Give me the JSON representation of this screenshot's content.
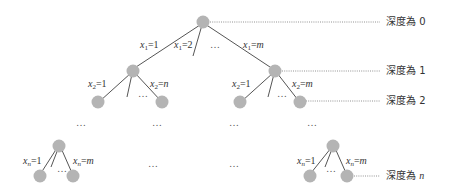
{
  "diagram": {
    "depth_labels": [
      {
        "text": "深度為 0",
        "prefix": "深度為 ",
        "value": "0",
        "italic": false
      },
      {
        "text": "深度為 1",
        "prefix": "深度為 ",
        "value": "1",
        "italic": false
      },
      {
        "text": "深度為 2",
        "prefix": "深度為 ",
        "value": "2",
        "italic": false
      },
      {
        "text": "深度為 n",
        "prefix": "深度為 ",
        "value": "n",
        "italic": true
      }
    ],
    "edge_labels": {
      "root_left": {
        "var": "x",
        "sub": "1",
        "val": "1"
      },
      "root_second": {
        "var": "x",
        "sub": "1",
        "val": "2"
      },
      "root_right": {
        "var": "x",
        "sub": "1",
        "val": "m"
      },
      "left_d1_left": {
        "var": "x",
        "sub": "2",
        "val": "1"
      },
      "left_d1_right": {
        "var": "x",
        "sub": "2",
        "val": "n"
      },
      "right_d1_left": {
        "var": "x",
        "sub": "2",
        "val": "1"
      },
      "right_d1_right": {
        "var": "x",
        "sub": "2",
        "val": "m"
      },
      "bottom_left_left": {
        "var": "x",
        "sub": "n",
        "val": "1"
      },
      "bottom_left_right": {
        "var": "x",
        "sub": "n",
        "val": "m"
      },
      "bottom_right_left": {
        "var": "x",
        "sub": "n",
        "val": "1"
      },
      "bottom_right_right": {
        "var": "x",
        "sub": "n",
        "val": "m"
      }
    },
    "ellipsis": "…",
    "nodes": [
      {
        "id": "root",
        "depth": 0
      },
      {
        "id": "d1-left",
        "depth": 1
      },
      {
        "id": "d1-right",
        "depth": 1
      },
      {
        "id": "d2-1",
        "depth": 2
      },
      {
        "id": "d2-2",
        "depth": 2
      },
      {
        "id": "d2-3",
        "depth": 2
      },
      {
        "id": "d2-4",
        "depth": 2
      },
      {
        "id": "dn-left-root",
        "depth": "n-1"
      },
      {
        "id": "dn-left-1",
        "depth": "n"
      },
      {
        "id": "dn-left-2",
        "depth": "n"
      },
      {
        "id": "dn-right-root",
        "depth": "n-1"
      },
      {
        "id": "dn-right-1",
        "depth": "n"
      },
      {
        "id": "dn-right-2",
        "depth": "n"
      }
    ]
  }
}
